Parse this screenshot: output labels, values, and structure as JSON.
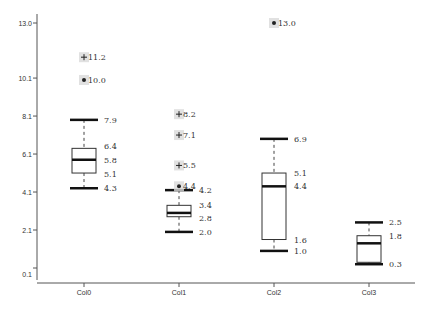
{
  "chart_data": {
    "type": "boxplot",
    "title": "",
    "xlabel": "",
    "ylabel": "",
    "ylim": [
      0.1,
      13.0
    ],
    "y_ticks": [
      "13.0",
      "10.1",
      "8.1",
      "6.1",
      "4.1",
      "2.1",
      "0.1"
    ],
    "y_tick_values": [
      13.0,
      10.1,
      8.1,
      6.1,
      4.1,
      2.1,
      0.1
    ],
    "grid": false,
    "legend": null,
    "categories": [
      "Col0",
      "Col1",
      "Col2",
      "Col3"
    ],
    "series": [
      {
        "name": "Col0",
        "whisker_high": 7.9,
        "q3": 6.4,
        "median": 5.8,
        "q1": 5.1,
        "whisker_low": 4.3,
        "labels": {
          "whisker_high": "7.9",
          "q3": "6.4",
          "median": "5.8",
          "q1": "5.1",
          "whisker_low": "4.3"
        },
        "outliers": [
          {
            "value": 11.2,
            "label": "11.2",
            "marker": "plus"
          },
          {
            "value": 10.0,
            "label": "10.0",
            "marker": "dot"
          }
        ]
      },
      {
        "name": "Col1",
        "whisker_high": 4.2,
        "q3": 3.4,
        "median": 3.0,
        "q1": 2.8,
        "whisker_low": 2.0,
        "labels": {
          "whisker_high": "4.2",
          "q3": "3.4",
          "median": "",
          "q1": "2.8",
          "whisker_low": "2.0"
        },
        "outliers": [
          {
            "value": 8.2,
            "label": "8.2",
            "marker": "plus"
          },
          {
            "value": 7.1,
            "label": "7.1",
            "marker": "plus"
          },
          {
            "value": 5.5,
            "label": "5.5",
            "marker": "plus"
          },
          {
            "value": 4.4,
            "label": "4.4",
            "marker": "dot"
          }
        ]
      },
      {
        "name": "Col2",
        "whisker_high": 6.9,
        "q3": 5.1,
        "median": 4.4,
        "q1": 1.6,
        "whisker_low": 1.0,
        "labels": {
          "whisker_high": "6.9",
          "q3": "5.1",
          "median": "4.4",
          "q1": "1.6",
          "whisker_low": "1.0"
        },
        "outliers": [
          {
            "value": 13.0,
            "label": "13.0",
            "marker": "dot"
          }
        ]
      },
      {
        "name": "Col3",
        "whisker_high": 2.5,
        "q3": 1.8,
        "median": 1.4,
        "q1": 0.4,
        "whisker_low": 0.3,
        "labels": {
          "whisker_high": "2.5",
          "q3": "1.8",
          "median": "",
          "q1": "",
          "whisker_low": "0.3"
        },
        "outliers": []
      }
    ]
  },
  "colors": {
    "axis": "#555555",
    "box_stroke": "#333333",
    "whisker": "#111111",
    "outlier_bg": "#d9d9d9",
    "text": "#333333"
  }
}
